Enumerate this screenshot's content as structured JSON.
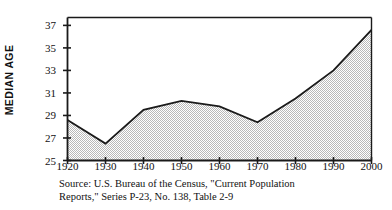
{
  "chart_data": {
    "type": "area",
    "title": "",
    "xlabel": "",
    "ylabel": "MEDIAN AGE",
    "categories": [
      1920,
      1930,
      1940,
      1950,
      1960,
      1970,
      1980,
      1990,
      2000
    ],
    "values": [
      28.6,
      26.5,
      29.5,
      30.3,
      29.8,
      28.4,
      30.5,
      33.0,
      36.6
    ],
    "series": [
      {
        "name": "Median age of U.S. population",
        "values": [
          28.6,
          26.5,
          29.5,
          30.3,
          29.8,
          28.4,
          30.5,
          33.0,
          36.6
        ]
      }
    ],
    "xlim": [
      1920,
      2000
    ],
    "ylim": [
      25,
      37.7
    ],
    "xticks": [
      1920,
      1930,
      1940,
      1950,
      1960,
      1970,
      1980,
      1990,
      2000
    ],
    "yticks": [
      25,
      27,
      29,
      31,
      33,
      35,
      37
    ],
    "xtick_labels": [
      "1920",
      "1930",
      "1940",
      "1950",
      "1960",
      "1970",
      "1980",
      "1990",
      "2000"
    ],
    "ytick_labels": [
      "25",
      "27",
      "29",
      "31",
      "33",
      "35",
      "37"
    ],
    "grid": false,
    "legend": false,
    "legend_position": "none",
    "fill_color": "#d9d9d9",
    "line_color": "#1a1a1a",
    "axis_color": "#1a1a1a",
    "background_color": "#ffffff"
  },
  "axes": {
    "y_title": "MEDIAN AGE"
  },
  "source": {
    "line1": "Source: U.S. Bureau of the Census, \"Current Population",
    "line2": "Reports,\" Series P-23, No. 138, Table 2-9"
  }
}
